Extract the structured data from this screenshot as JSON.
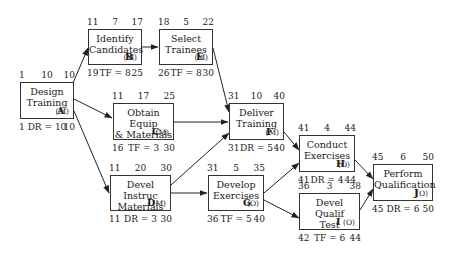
{
  "nodes": {
    "A": {
      "name": "Design\nTraining",
      "code": "A",
      "type": "(M)",
      "top": [
        "1",
        "10",
        "10"
      ],
      "bottom": [
        "1",
        "DR = 10",
        "10"
      ]
    },
    "B": {
      "name": "Identify\nCandidates",
      "code": "B",
      "type": "(M)",
      "top": [
        "11",
        "7",
        "17"
      ],
      "bottom": [
        "19",
        "TF = 8",
        "25"
      ]
    },
    "E": {
      "name": "Select\nTrainees",
      "code": "E",
      "type": "(M)",
      "top": [
        "18",
        "5",
        "22"
      ],
      "bottom": [
        "26",
        "TF = 8",
        "30"
      ]
    },
    "C": {
      "name": "Obtain Equip\n& Materials",
      "code": "C",
      "type": "(M)",
      "top": [
        "11",
        "17",
        "25"
      ],
      "bottom": [
        "16",
        "TF = 3",
        "30"
      ]
    },
    "F": {
      "name": "Deliver\nTraining",
      "code": "F",
      "type": "(M)",
      "top": [
        "31",
        "10",
        "40"
      ],
      "bottom": [
        "31",
        "DR = 5",
        "40"
      ]
    },
    "D": {
      "name": "Devel Instruc\nMaterials",
      "code": "D",
      "type": "(M)",
      "top": [
        "11",
        "20",
        "30"
      ],
      "bottom": [
        "11",
        "DR = 3",
        "30"
      ]
    },
    "G": {
      "name": "Develop\nExercises",
      "code": "G",
      "type": "(O)",
      "top": [
        "31",
        "5",
        "35"
      ],
      "bottom": [
        "36",
        "TF = 5",
        "40"
      ]
    },
    "H": {
      "name": "Conduct\nExercises",
      "code": "H",
      "type": "(O)",
      "top": [
        "41",
        "4",
        "44"
      ],
      "bottom": [
        "41",
        "DR = 4",
        "44"
      ]
    },
    "I": {
      "name": "Devel Qualif\nTest",
      "code": "I",
      "type": "(O)",
      "top": [
        "36",
        "3",
        "38"
      ],
      "bottom": [
        "42",
        "TF = 6",
        "44"
      ]
    },
    "J": {
      "name": "Perform\nQualification",
      "code": "J",
      "type": "(O)",
      "top": [
        "45",
        "6",
        "50"
      ],
      "bottom": [
        "45",
        "DR = 6",
        "50"
      ]
    }
  },
  "edges": [
    [
      "A",
      "B"
    ],
    [
      "A",
      "C"
    ],
    [
      "A",
      "D"
    ],
    [
      "B",
      "E"
    ],
    [
      "E",
      "F"
    ],
    [
      "C",
      "F"
    ],
    [
      "D",
      "F"
    ],
    [
      "D",
      "G"
    ],
    [
      "F",
      "H"
    ],
    [
      "G",
      "H"
    ],
    [
      "G",
      "I"
    ],
    [
      "H",
      "J"
    ],
    [
      "I",
      "J"
    ]
  ]
}
